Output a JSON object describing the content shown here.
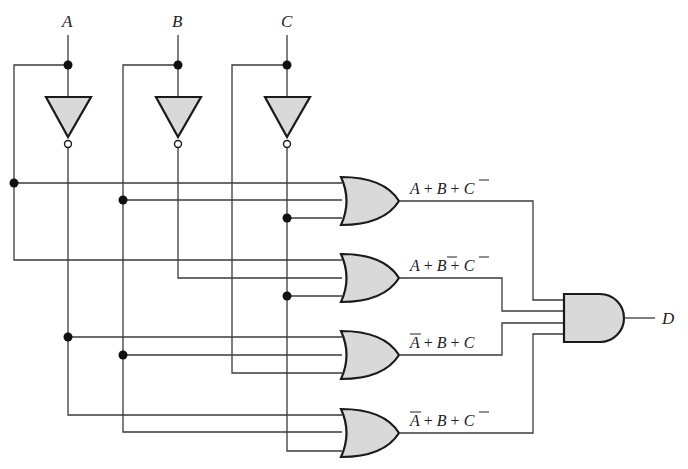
{
  "diagram": {
    "type": "logic-circuit",
    "inputs": [
      {
        "name": "A",
        "x": 68
      },
      {
        "name": "B",
        "x": 178
      },
      {
        "name": "C",
        "x": 287
      }
    ],
    "inverters": [
      {
        "input": "A",
        "output": "A-bar"
      },
      {
        "input": "B",
        "output": "B-bar"
      },
      {
        "input": "C",
        "output": "C-bar"
      }
    ],
    "or_gates": [
      {
        "id": "or1",
        "label_parts": [
          "A",
          "+",
          "B",
          "+",
          "C"
        ],
        "complemented": [
          false,
          false,
          true
        ],
        "inputs": [
          "A",
          "B",
          "C-bar"
        ]
      },
      {
        "id": "or2",
        "label_parts": [
          "A",
          "+",
          "B",
          "+",
          "C"
        ],
        "complemented": [
          false,
          true,
          true
        ],
        "inputs": [
          "A",
          "B-bar",
          "C-bar"
        ]
      },
      {
        "id": "or3",
        "label_parts": [
          "A",
          "+",
          "B",
          "+",
          "C"
        ],
        "complemented": [
          true,
          false,
          false
        ],
        "inputs": [
          "A-bar",
          "B",
          "C"
        ]
      },
      {
        "id": "or4",
        "label_parts": [
          "A",
          "+",
          "B",
          "+",
          "C"
        ],
        "complemented": [
          true,
          false,
          true
        ],
        "inputs": [
          "A-bar",
          "B",
          "C-bar"
        ]
      }
    ],
    "and_gate": {
      "id": "and1",
      "inputs": [
        "or1",
        "or2",
        "or3",
        "or4"
      ],
      "output": "D"
    },
    "labels": {
      "input_a": "A",
      "input_b": "B",
      "input_c": "C",
      "output_d": "D",
      "or1_expr": "A + B + C̄",
      "or2_expr": "A + B̄ + C̄",
      "or3_expr": "Ā + B + C",
      "or4_expr": "Ā + B + C̄"
    },
    "colors": {
      "gate_fill": "#d9d9d9",
      "gate_stroke": "#1a1a1a",
      "wire": "#3a3a3a",
      "background": "#ffffff"
    }
  }
}
